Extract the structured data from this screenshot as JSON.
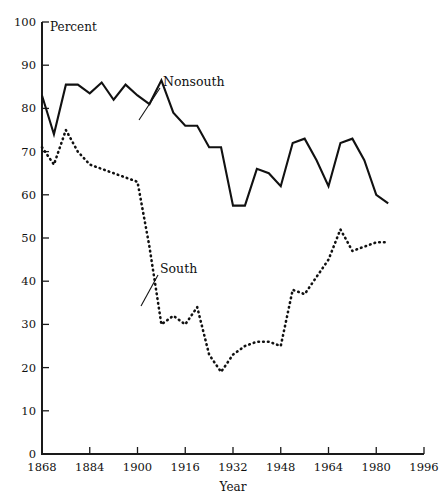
{
  "chart_data": {
    "type": "line",
    "title": "",
    "xlabel": "Year",
    "ylabel": "Percent",
    "xlim": [
      1868,
      1996
    ],
    "ylim": [
      0,
      100
    ],
    "grid": false,
    "legend_position": "inline-annotations",
    "xticks": [
      1868,
      1884,
      1900,
      1916,
      1932,
      1948,
      1964,
      1980,
      1996
    ],
    "yticks": [
      0,
      10,
      20,
      30,
      40,
      50,
      60,
      70,
      80,
      90,
      100
    ],
    "annotations": [
      {
        "text": "Nonsouth",
        "series": "Nonsouth"
      },
      {
        "text": "South",
        "series": "South"
      }
    ],
    "series": [
      {
        "name": "Nonsouth",
        "style": "solid",
        "x": [
          1868,
          1872,
          1876,
          1880,
          1884,
          1888,
          1892,
          1896,
          1900,
          1904,
          1908,
          1912,
          1916,
          1920,
          1924,
          1928,
          1932,
          1936,
          1940,
          1944,
          1948,
          1952,
          1956,
          1960,
          1964,
          1968,
          1972,
          1976,
          1980,
          1984
        ],
        "values": [
          83,
          74,
          85.5,
          85.5,
          83.5,
          86,
          82,
          85.5,
          83,
          81,
          86.5,
          79,
          76,
          76,
          71,
          71,
          57.5,
          57.5,
          66,
          65,
          62,
          72,
          73,
          68,
          62,
          72,
          73,
          68,
          60,
          58
        ]
      },
      {
        "name": "South",
        "style": "dotted",
        "x": [
          1868,
          1872,
          1876,
          1880,
          1884,
          1888,
          1892,
          1896,
          1900,
          1904,
          1908,
          1912,
          1916,
          1920,
          1924,
          1928,
          1932,
          1936,
          1940,
          1944,
          1948,
          1952,
          1956,
          1960,
          1964,
          1968,
          1972,
          1976,
          1980,
          1984
        ],
        "values": [
          71,
          67,
          75,
          70,
          67,
          66,
          65,
          64,
          63,
          48,
          30,
          32,
          30,
          34,
          23,
          19,
          23,
          25,
          26,
          26,
          25,
          38,
          37,
          41,
          45,
          52,
          47,
          48,
          49,
          49
        ]
      }
    ]
  },
  "axis": {
    "y_title": "Percent",
    "x_title": "Year"
  }
}
